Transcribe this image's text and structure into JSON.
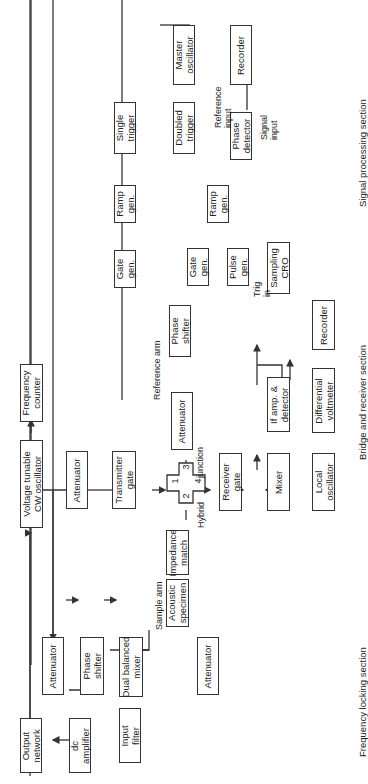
{
  "sections": {
    "frequency_locking": "Frequency locking section",
    "bridge_receiver": "Bridge and receiver section",
    "signal_processing": "Signal processing section"
  },
  "blocks": {
    "output_network": "Output\nnetwork",
    "dc_amplifier": "dc\namplifier",
    "input_filter": "Input\nfilter",
    "attenuator_fl1": "Attenuator",
    "phase_shifter_fl": "Phase\nshifter",
    "dual_balanced_mixer": "Dual balanced\nmixer",
    "attenuator_fl2": "Attenuator",
    "vco": "Voltage tunable\nCW oscillator",
    "frequency_counter": "Frequency\ncounter",
    "attenuator_main": "Attenuator",
    "transmitter_gate": "Transmitter\ngate",
    "acoustic_specimen": "Acoustic\nspecimen",
    "impedance_match": "Impedance\nmatch",
    "attenuator_ref": "Attenuator",
    "phase_shifter_ref": "Phase\nshifter",
    "receiver_gate": "Receiver\ngate",
    "mixer": "Mixer",
    "local_oscillator": "Local\noscillator",
    "if_amp": "If amp. &\ndetector",
    "differential_voltmeter": "Differential\nvoltmeter",
    "recorder_bridge": "Recorder",
    "sampling_cro": "Sampling\nCRO",
    "pulse_gen": "Pulse\ngen.",
    "gate_gen_2": "Gate\ngen.",
    "ramp_gen_2": "Ramp\ngen.",
    "doubled_trigger": "Doubled\ntrigger",
    "single_trigger": "Single\ntrigger",
    "ramp_gen_1": "Ramp\ngen.",
    "gate_gen_1": "Gate\ngen.",
    "master_oscillator": "Master\noscillator",
    "phase_detector": "Phase\ndetector",
    "recorder_signal": "Recorder"
  },
  "labels": {
    "sample_arm": "Sample arm",
    "reference_arm": "Reference arm",
    "hybrid": "Hybrid",
    "junction": "junction",
    "reference_input": "Reference\ninput",
    "signal_input": "Signal\ninput",
    "trig_in": "Trig\nin"
  },
  "ports": [
    "1",
    "2",
    "3",
    "4"
  ]
}
